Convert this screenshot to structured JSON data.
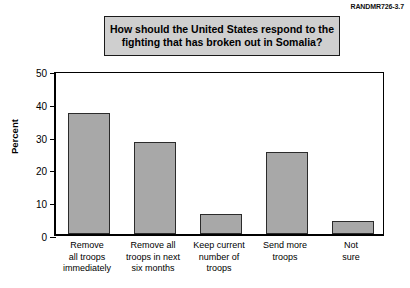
{
  "figure": {
    "id_label": "RANDMR726-3.7",
    "title_line1": "How should the United States respond to the",
    "title_line2": "fighting that has broken out in Somalia?"
  },
  "axis": {
    "y_title": "Percent",
    "ticks": [
      "0",
      "10",
      "20",
      "30",
      "40",
      "50"
    ]
  },
  "categories": [
    {
      "lines": [
        "Remove",
        "all troops",
        "immediately"
      ]
    },
    {
      "lines": [
        "Remove all",
        "troops in next",
        "six months"
      ]
    },
    {
      "lines": [
        "Keep current",
        "number of",
        "troops"
      ]
    },
    {
      "lines": [
        "Send more",
        "troops"
      ]
    },
    {
      "lines": [
        "Not",
        "sure"
      ]
    }
  ],
  "colors": {
    "bar_fill": "#a8a8a8",
    "bar_border": "#2b2b2b",
    "title_box_fill": "#cfcfcf",
    "axis": "#000000"
  },
  "chart_data": {
    "type": "bar",
    "title": "How should the United States respond to the fighting that has broken out in Somalia?",
    "xlabel": "",
    "ylabel": "Percent",
    "ylim": [
      0,
      50
    ],
    "ytick_values": [
      0,
      10,
      20,
      30,
      40,
      50
    ],
    "grid": false,
    "legend": "none",
    "categories": [
      "Remove all troops immediately",
      "Remove all troops in next six months",
      "Keep current number of troops",
      "Send more troops",
      "Not sure"
    ],
    "values": [
      37,
      28,
      6,
      25,
      4
    ]
  }
}
